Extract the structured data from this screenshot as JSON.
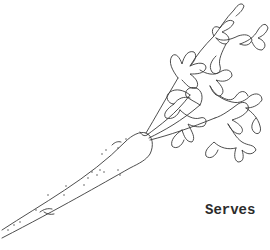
{
  "page": {
    "illustration": {
      "subject": "carrot-line-drawing",
      "stroke_color": "#3a3a3a",
      "background": "#ffffff"
    },
    "serves_label": "Serves"
  }
}
